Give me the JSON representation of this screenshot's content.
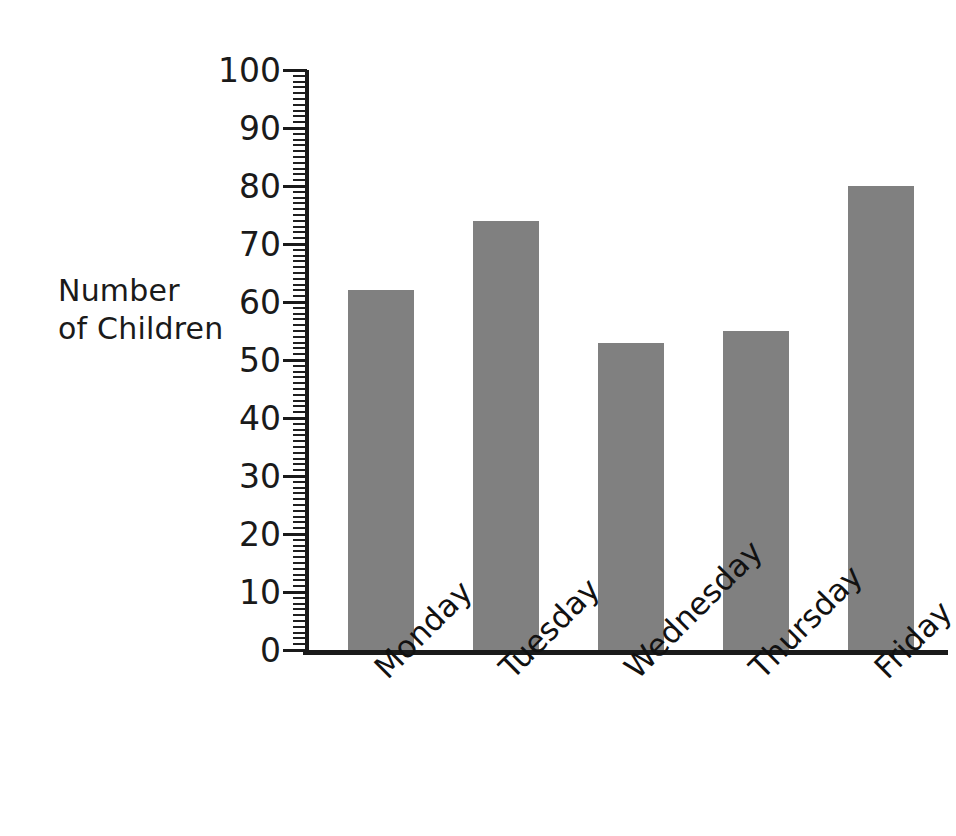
{
  "chart_data": {
    "type": "bar",
    "title": "",
    "subtitle": "",
    "xlabel": "",
    "ylabel": "Number\nof Children",
    "ylabel_line1": "Number",
    "ylabel_line2": "of Children",
    "categories": [
      "Monday",
      "Tuesday",
      "Wednesday",
      "Thursday",
      "Friday"
    ],
    "values": [
      62,
      74,
      53,
      55,
      80
    ],
    "ylim": [
      0,
      100
    ],
    "y_major_ticks": [
      0,
      10,
      20,
      30,
      40,
      50,
      60,
      70,
      80,
      90,
      100
    ],
    "y_tick_labels": [
      "0",
      "10",
      "20",
      "30",
      "40",
      "50",
      "60",
      "70",
      "80",
      "90",
      "100"
    ],
    "y_minor_tick_interval": 1,
    "grid": false,
    "legend": false,
    "legend_position": "none",
    "bar_color": "#808080",
    "axis_color": "#1a1a1a",
    "background_color": "#ffffff",
    "x_tick_label_rotation": -45
  }
}
